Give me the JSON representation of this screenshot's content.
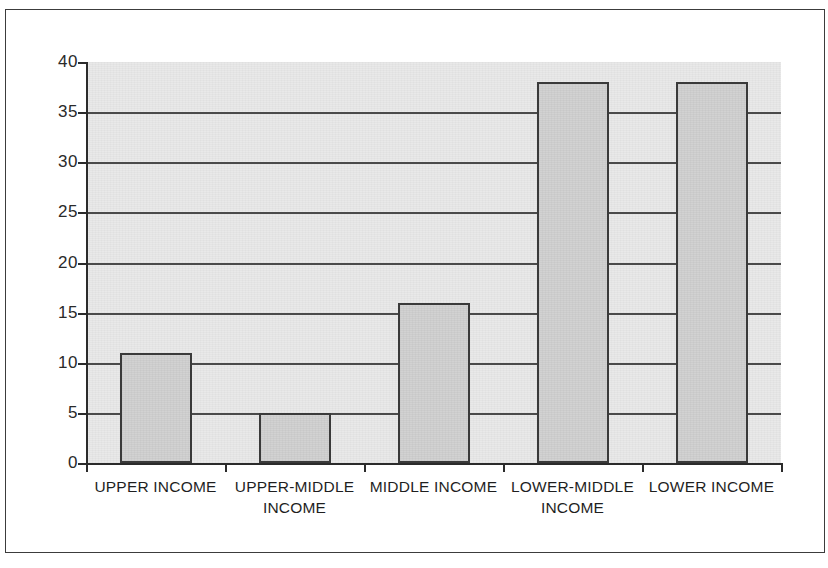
{
  "chart_data": {
    "type": "bar",
    "title": "",
    "xlabel": "",
    "ylabel": "",
    "categories": [
      "UPPER INCOME",
      "UPPER-MIDDLE INCOME",
      "MIDDLE INCOME",
      "LOWER-MIDDLE INCOME",
      "LOWER INCOME"
    ],
    "values": [
      11,
      5,
      16,
      38,
      38
    ],
    "ylim": [
      0,
      40
    ],
    "ytick_step": 5,
    "ytick_labels": [
      "40",
      "35",
      "30",
      "25",
      "20",
      "15",
      "10",
      "5",
      "0"
    ],
    "grid": true,
    "grid_axis": "y",
    "legend": null,
    "legend_position": "none",
    "series": [
      {
        "name": "",
        "values": [
          11,
          5,
          16,
          38,
          38
        ]
      }
    ],
    "colors": {
      "bar_fill": "#d2d2d2",
      "bar_edge": "#3a3a3a",
      "plot_background": "#e9e9e9",
      "gridline": "#4a4a4a",
      "axis": "#2b2b2b",
      "text": "#1f1f1f",
      "page_border": "#3c3c3c",
      "page_background": "#ffffff"
    }
  }
}
